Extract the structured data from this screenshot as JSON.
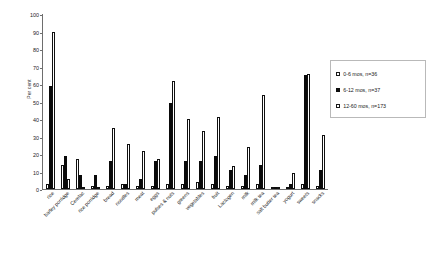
{
  "chart_data": {
    "type": "bar",
    "title": "",
    "xlabel": "",
    "ylabel": "Per cent",
    "ylim": [
      0,
      100
    ],
    "yticks": [
      0,
      10,
      20,
      30,
      40,
      50,
      60,
      70,
      80,
      90,
      100
    ],
    "grid": false,
    "legend_position": "right",
    "categories": [
      "rice",
      "barley porridge",
      "Cerelac",
      "rice porridge",
      "bread",
      "noodles",
      "meat",
      "eggs",
      "pulses & nuts",
      "greens",
      "vegetables",
      "fruit",
      "Lactogen",
      "milk",
      "milk tea",
      "salt butter tea",
      "yogurt",
      "sweets",
      "snacks"
    ],
    "series": [
      {
        "name": "0-6 mos, n=36",
        "style": "open",
        "values": [
          3,
          14,
          17,
          2,
          2,
          3,
          2,
          2,
          3,
          3,
          4,
          3,
          2,
          2,
          3,
          0,
          0,
          3,
          2
        ]
      },
      {
        "name": "6-12 mos, n=37",
        "style": "solid",
        "values": [
          59,
          19,
          8,
          8,
          16,
          3,
          6,
          16,
          49,
          16,
          16,
          19,
          11,
          8,
          14,
          0,
          3,
          65,
          11
        ]
      },
      {
        "name": "12-60 mos, n=173",
        "style": "open",
        "values": [
          90,
          6,
          1,
          1,
          35,
          26,
          22,
          17,
          62,
          40,
          33,
          41,
          13,
          24,
          54,
          0,
          9,
          66,
          31
        ]
      }
    ]
  },
  "legend": {
    "items": [
      {
        "label": "0-6 mos, n=36",
        "style": "open"
      },
      {
        "label": "6-12 mos, n=37",
        "style": "solid"
      },
      {
        "label": "12-60 mos, n=173",
        "style": "open"
      }
    ]
  }
}
